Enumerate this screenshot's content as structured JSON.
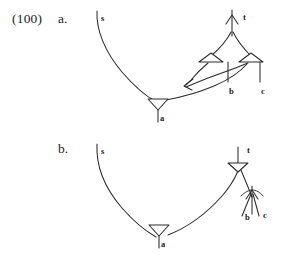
{
  "figure": {
    "example_number": "(100)",
    "background_color": "#ffffff",
    "ink_color": "#2b2b2b",
    "text_color": "#1d1d1d"
  },
  "items": [
    {
      "letter": "a.",
      "description": "multiple-movement derivation with two crossing movement arrows converging on one landing site",
      "nodes": [
        {
          "id": "s-a",
          "label": "s",
          "x": 101,
          "y": 14
        },
        {
          "id": "t-a",
          "label": "t",
          "x": 243,
          "y": 13
        },
        {
          "id": "b-a",
          "label": "b",
          "x": 229,
          "y": 87
        },
        {
          "id": "c-a",
          "label": "c",
          "x": 261,
          "y": 87
        },
        {
          "id": "a-a",
          "label": "a",
          "x": 160,
          "y": 114
        }
      ],
      "arrow_count": 2,
      "triangle_nodes": [
        "t-attachment-left",
        "t-attachment-right",
        "a-head"
      ]
    },
    {
      "letter": "b.",
      "description": "single remnant-movement derivation, b and c raised together under t",
      "nodes": [
        {
          "id": "s-b",
          "label": "s",
          "x": 101,
          "y": 147
        },
        {
          "id": "t-b",
          "label": "t",
          "x": 247,
          "y": 146
        },
        {
          "id": "b-b",
          "label": "b",
          "x": 245,
          "y": 213
        },
        {
          "id": "c-b",
          "label": "c",
          "x": 263,
          "y": 211
        },
        {
          "id": "a-b",
          "label": "a",
          "x": 161,
          "y": 240
        }
      ],
      "arrow_count": 1,
      "triangle_nodes": [
        "t-head",
        "a-head"
      ]
    }
  ]
}
